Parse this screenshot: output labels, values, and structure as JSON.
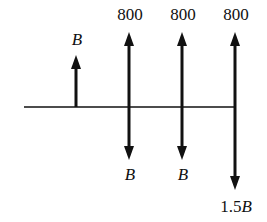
{
  "diagram": {
    "type": "cash-flow",
    "colors": {
      "ink": "#111111",
      "background": "#ffffff"
    },
    "baseline": {
      "x1": 24,
      "x2": 235,
      "y": 107
    },
    "flows": [
      {
        "id": "b-receipt",
        "x": 76,
        "direction": "up",
        "tip_y": 55,
        "label": "B",
        "label_italic": true
      },
      {
        "id": "receipt-1",
        "x": 129,
        "direction": "up",
        "tip_y": 32,
        "label": "800",
        "label_italic": false
      },
      {
        "id": "receipt-2",
        "x": 182,
        "direction": "up",
        "tip_y": 32,
        "label": "800",
        "label_italic": false
      },
      {
        "id": "receipt-3",
        "x": 235,
        "direction": "up",
        "tip_y": 32,
        "label": "800",
        "label_italic": false
      },
      {
        "id": "payment-1",
        "x": 129,
        "direction": "down",
        "tip_y": 160,
        "label": "B",
        "label_italic": true
      },
      {
        "id": "payment-2",
        "x": 182,
        "direction": "down",
        "tip_y": 160,
        "label": "B",
        "label_italic": true
      },
      {
        "id": "payment-3",
        "x": 235,
        "direction": "down",
        "tip_y": 190,
        "label": "1.5B",
        "label_italic": false
      }
    ]
  },
  "labels": {
    "b_up": "B",
    "r1": "800",
    "r2": "800",
    "r3": "800",
    "p1": "B",
    "p2": "B",
    "p3_num": "1.5",
    "p3_var": "B"
  }
}
